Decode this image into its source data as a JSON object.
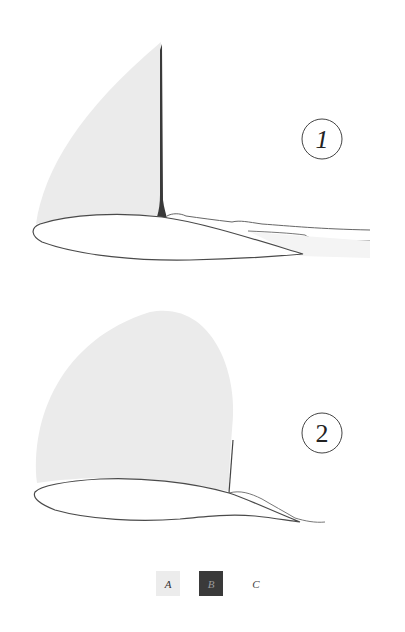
{
  "figure": {
    "panels": [
      {
        "id": "1",
        "label": "1",
        "description": "Airfoil with narrow separated-flow region; tall shaded pressure region A bounded by dark vertical band B, wake C trailing downstream"
      },
      {
        "id": "2",
        "label": "2",
        "description": "Airfoil with large rounded shaded region A extending over most of the upper surface; short vertical boundary near mid-chord"
      }
    ],
    "legend": {
      "items": [
        {
          "key": "A",
          "label": "A",
          "color": "#ececec"
        },
        {
          "key": "B",
          "label": "B",
          "color": "#3a3a3a"
        },
        {
          "key": "C",
          "label": "C",
          "color": "#ffffff"
        }
      ]
    },
    "colors": {
      "region_a": "#ebebeb",
      "region_b": "#3a3a3a",
      "outline": "#555555",
      "background": "#ffffff"
    }
  }
}
